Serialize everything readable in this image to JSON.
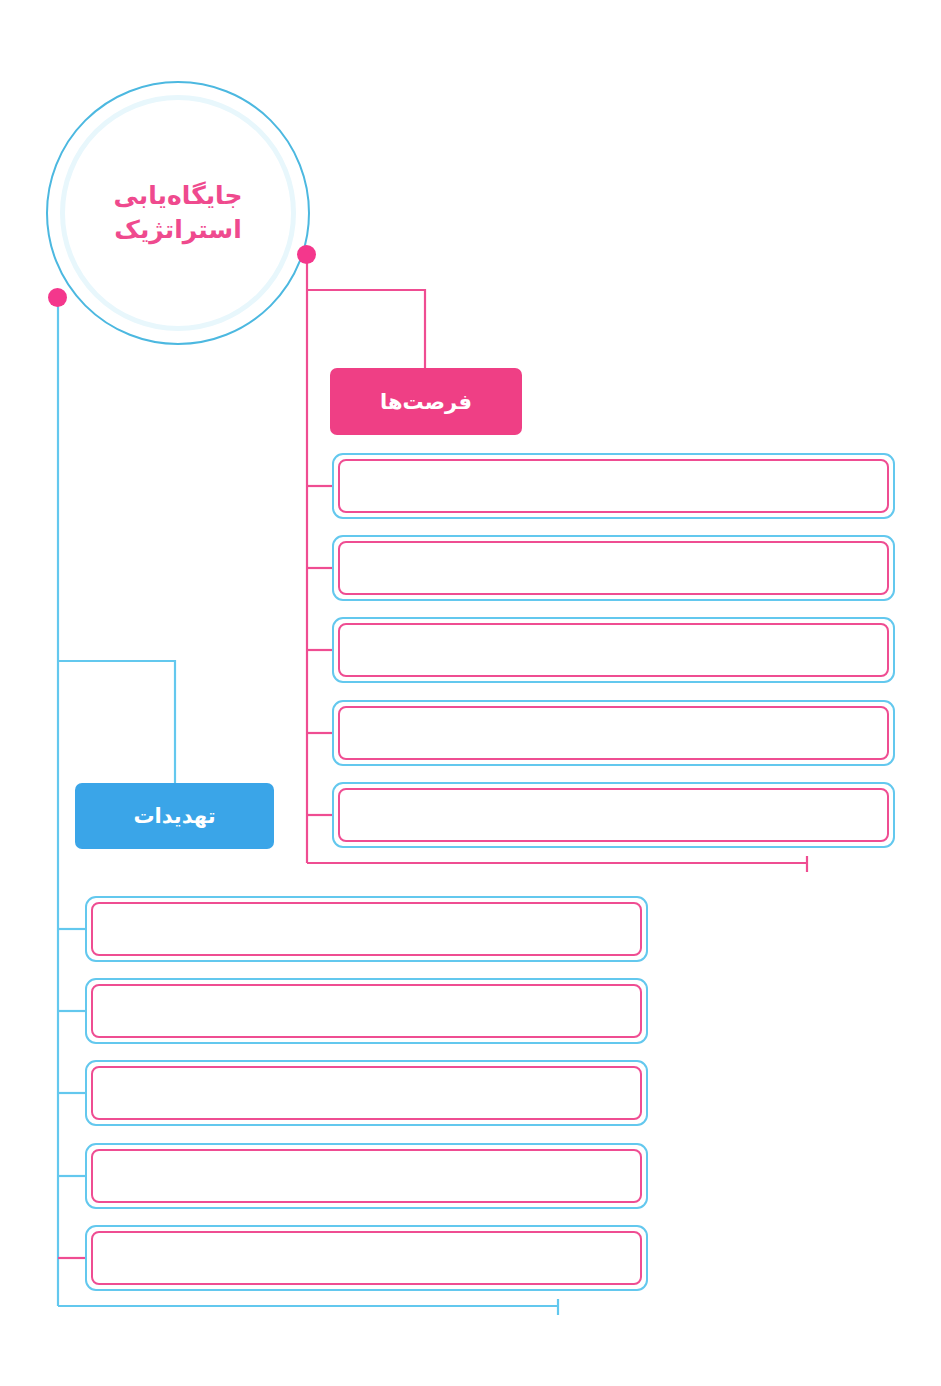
{
  "diagram": {
    "type": "swot-branch-map",
    "hub": {
      "line1": "جایگاه‌یابی",
      "line2": "استراتژیک",
      "text_color": "#ef4a8e",
      "ring_color": "#4cb8e0"
    },
    "branches": [
      {
        "id": "opportunities",
        "label": "فرصت‌ها",
        "accent": "#ef3f85",
        "connector_color": "#ef4d92",
        "items": [
          {
            "text": ""
          },
          {
            "text": ""
          },
          {
            "text": ""
          },
          {
            "text": ""
          },
          {
            "text": ""
          }
        ]
      },
      {
        "id": "threats",
        "label": "تهدیدات",
        "accent": "#3aa5e8",
        "connector_color": "#63c8ee",
        "items": [
          {
            "text": ""
          },
          {
            "text": ""
          },
          {
            "text": ""
          },
          {
            "text": ""
          },
          {
            "text": ""
          }
        ]
      }
    ],
    "palette": {
      "pink": "#ef4d92",
      "pink_dot": "#f4378c",
      "blue": "#63c8ee",
      "blue_solid": "#3aa5e8",
      "box_fill": "#ffffff",
      "background": "#ffffff"
    }
  }
}
